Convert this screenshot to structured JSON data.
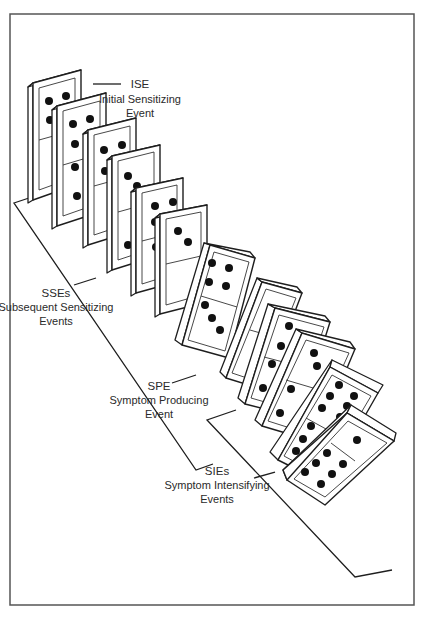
{
  "frame": {
    "border_color": "#555555"
  },
  "labels": {
    "ise": {
      "abbr": "ISE",
      "line1": "Initial Sensitizing",
      "line2": "Event"
    },
    "sses": {
      "abbr": "SSEs",
      "line1": "Subsequent Sensitizing",
      "line2": "Events"
    },
    "spe": {
      "abbr": "SPE",
      "line1": "Symptom Producing",
      "line2": "Event"
    },
    "sies": {
      "abbr": "SIEs",
      "line1": "Symptom Intensifying",
      "line2": "Events"
    }
  },
  "dominoes": [
    {
      "group": "ISE",
      "top_pips": 4,
      "bottom_pips": 0
    },
    {
      "group": "SSE",
      "top_pips": 4,
      "bottom_pips": 2
    },
    {
      "group": "SSE",
      "top_pips": 4,
      "bottom_pips": 1
    },
    {
      "group": "SSE",
      "top_pips": 2,
      "bottom_pips": 1
    },
    {
      "group": "SSE",
      "top_pips": 4,
      "bottom_pips": 1
    },
    {
      "group": "SSE",
      "top_pips": 2,
      "bottom_pips": 0
    },
    {
      "group": "SSE",
      "top_pips": 4,
      "bottom_pips": 3
    },
    {
      "group": "SPE",
      "top_pips": 1,
      "bottom_pips": 0
    },
    {
      "group": "SIE",
      "top_pips": 3,
      "bottom_pips": 2
    },
    {
      "group": "SIE",
      "top_pips": 2,
      "bottom_pips": 2
    },
    {
      "group": "SIE",
      "top_pips": 6,
      "bottom_pips": 3
    },
    {
      "group": "SIE",
      "top_pips": 1,
      "bottom_pips": 6
    }
  ]
}
